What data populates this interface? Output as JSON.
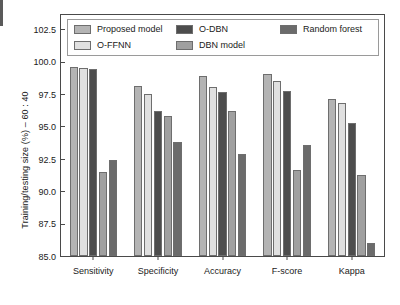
{
  "chart_data": {
    "type": "bar",
    "title": "",
    "xlabel": "",
    "ylabel": "Training/testing size (%) – 60 : 40",
    "ylim": [
      85.0,
      103.6
    ],
    "yticks": [
      85.0,
      87.5,
      90.0,
      92.5,
      95.0,
      97.5,
      100.0,
      102.5
    ],
    "ytick_labels": [
      "85.0",
      "87.5",
      "90.0",
      "92.5",
      "95.0",
      "97.5",
      "100.0",
      "102.5"
    ],
    "grid": false,
    "legend_position": "upper-left-inside",
    "categories": [
      "Sensitivity",
      "Specificity",
      "Accuracy",
      "F-score",
      "Kappa"
    ],
    "series": [
      {
        "name": "Proposed model",
        "color": "#b4b4b4",
        "values": [
          99.6,
          98.15,
          98.9,
          99.05,
          97.15
        ]
      },
      {
        "name": "O-FFNN",
        "color": "#e0e0e0",
        "values": [
          99.5,
          97.5,
          98.05,
          98.5,
          96.8
        ]
      },
      {
        "name": "O-DBN",
        "color": "#4d4d4d",
        "values": [
          99.4,
          96.2,
          97.65,
          97.75,
          95.25
        ]
      },
      {
        "name": "DBN model",
        "color": "#a0a0a0",
        "values": [
          91.5,
          95.8,
          96.2,
          91.6,
          91.25
        ]
      },
      {
        "name": "Random forest",
        "color": "#6b6b6b",
        "values": [
          92.4,
          93.8,
          92.9,
          93.6,
          86.0
        ]
      }
    ]
  },
  "legend": {
    "items": [
      {
        "label": "Proposed model"
      },
      {
        "label": "O-FFNN"
      },
      {
        "label": "O-DBN"
      },
      {
        "label": "DBN model"
      },
      {
        "label": "Random forest"
      }
    ]
  }
}
